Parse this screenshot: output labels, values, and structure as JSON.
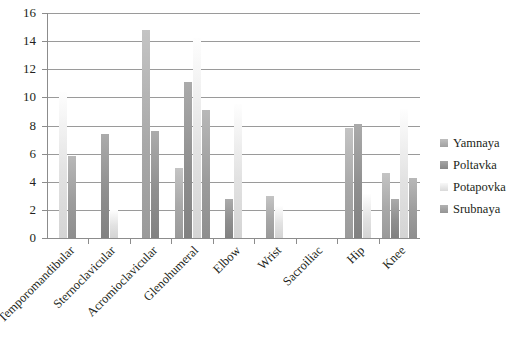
{
  "chart_data": {
    "type": "bar",
    "title": "",
    "subtitle": "",
    "xlabel": "",
    "ylabel": "",
    "ylim": [
      0,
      16
    ],
    "ytick_step": 2,
    "ytick_labels": [
      "16",
      "14",
      "12",
      "10",
      "8",
      "6",
      "4",
      "2",
      "0"
    ],
    "grid": true,
    "legend_position": "right",
    "categories": [
      "Temporomandibular",
      "Sternoclavicular",
      "Acromioclavicular",
      "Glenohumeral",
      "Elbow",
      "Wrist",
      "Sacroiliac",
      "Hip",
      "Knee"
    ],
    "series": [
      {
        "name": "Yamnaya",
        "color": "#a8a8a8",
        "values": [
          null,
          null,
          14.8,
          5.0,
          null,
          3.0,
          null,
          7.8,
          4.6
        ]
      },
      {
        "name": "Poltavka",
        "color": "#8f8f8f",
        "values": [
          null,
          7.4,
          7.6,
          11.1,
          2.8,
          null,
          null,
          8.1,
          2.8
        ]
      },
      {
        "name": "Potapovka",
        "color": "#e2e2e2",
        "values": [
          10.4,
          2.0,
          null,
          14.2,
          9.5,
          2.3,
          null,
          3.1,
          9.2
        ]
      },
      {
        "name": "Srubnaya",
        "color": "#9c9c9c",
        "values": [
          5.8,
          null,
          null,
          9.1,
          null,
          null,
          null,
          null,
          4.3
        ]
      }
    ]
  },
  "legend": {
    "items": [
      {
        "label": "Yamnaya",
        "color": "#a8a8a8"
      },
      {
        "label": "Poltavka",
        "color": "#8f8f8f"
      },
      {
        "label": "Potapovka",
        "color": "#e2e2e2"
      },
      {
        "label": "Srubnaya",
        "color": "#9c9c9c"
      }
    ]
  },
  "colors": {
    "axis": "#8c8c8c",
    "grid": "#9a9a9a",
    "text": "#231f20",
    "background": "#ffffff"
  }
}
